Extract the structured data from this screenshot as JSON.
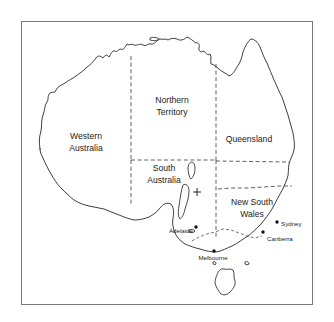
{
  "figure": {
    "frame": {
      "x": 21,
      "y": 21,
      "width": 292,
      "height": 284,
      "stroke_color": "#7a7a7a",
      "background": "#ffffff"
    },
    "coast_color": "#1b1b1b",
    "border_color": "#2b2b2b",
    "label_color": "#1a1a1a"
  },
  "states": [
    {
      "id": "western-australia",
      "label_line1": "Western",
      "label_line2": "Australia",
      "label_x": 86,
      "label_y": 140
    },
    {
      "id": "northern-territory",
      "label_line1": "Northern",
      "label_line2": "Territory",
      "label_x": 172,
      "label_y": 105
    },
    {
      "id": "queensland",
      "label_line1": "Queensland",
      "label_line2": "",
      "label_x": 249,
      "label_y": 140
    },
    {
      "id": "south-australia",
      "label_line1": "South",
      "label_line2": "Australia",
      "label_x": 165,
      "label_y": 172
    },
    {
      "id": "new-south-wales",
      "label_line1": "New South",
      "label_line2": "Wales",
      "label_x": 252,
      "label_y": 205
    }
  ],
  "cities": [
    {
      "id": "sydney",
      "name": "Sydney",
      "dot_x": 277,
      "dot_y": 222,
      "label_x": 281,
      "label_y": 224,
      "align": "right"
    },
    {
      "id": "canberra",
      "name": "Canberra",
      "dot_x": 263,
      "dot_y": 232,
      "label_x": 267,
      "label_y": 239,
      "align": "right"
    },
    {
      "id": "melbourne",
      "name": "Melbourne",
      "dot_x": 214,
      "dot_y": 251,
      "label_x": 213,
      "label_y": 258,
      "align": "center"
    },
    {
      "id": "adelaide",
      "name": "Adelaide",
      "dot_x": 196,
      "dot_y": 227,
      "label_x": 193,
      "label_y": 231,
      "align": "left"
    }
  ],
  "markers": [
    {
      "id": "site-marker",
      "symbol": "+",
      "x": 197,
      "y": 192,
      "size": 4.2
    }
  ],
  "geometry": {
    "mainland": "M 41 145 L 40 136 L 42 128 L 41 121 L 44 114 L 43 108 L 47 103 L 46 97 L 50 94 L 54 96 L 55 91 L 60 87 L 64 85 L 68 81 L 73 79 L 77 75 L 82 73 L 85 69 L 89 66 L 93 63 L 96 58 L 99 56 L 103 57 L 105 54 L 108 57 L 111 54 L 113 50 L 117 52 L 119 48 L 122 50 L 125 47 L 126 43 L 130 45 L 133 42 L 136 45 L 140 43 L 143 46 L 146 43 L 148 46 L 152 44 L 155 41 L 159 39 L 162 41 L 164 38 L 168 40 L 171 37 L 175 39 L 179 38 L 182 41 L 186 40 L 189 37 L 192 39 L 195 43 L 199 41 L 200 45 L 198 49 L 201 52 L 204 50 L 206 54 L 209 52 L 211 56 L 208 60 L 210 64 L 214 63 L 217 67 L 221 70 L 225 72 L 228 76 L 232 74 L 236 70 L 239 65 L 241 59 L 243 53 L 245 47 L 248 42 L 252 39 L 256 41 L 259 45 L 261 51 L 263 57 L 266 62 L 269 67 L 271 73 L 273 79 L 276 84 L 278 90 L 281 95 L 283 101 L 285 107 L 287 113 L 289 119 L 290 125 L 292 131 L 293 137 L 294 143 L 293 149 L 291 154 L 289 159 L 288 165 L 289 171 L 288 177 L 285 182 L 283 188 L 280 193 L 277 198 L 274 203 L 271 208 L 268 213 L 264 218 L 260 223 L 256 228 L 251 232 L 246 236 L 241 240 L 236 243 L 231 246 L 226 249 L 221 251 L 216 252 L 211 251 L 206 250 L 201 249 L 196 248 L 191 247 L 186 245 L 181 242 L 177 238 L 174 233 L 172 228 L 171 223 L 172 218 L 173 213 L 172 208 L 169 204 L 165 203 L 161 205 L 158 209 L 155 213 L 151 216 L 147 218 L 142 219 L 137 220 L 132 219 L 127 218 L 122 216 L 117 214 L 112 212 L 107 210 L 102 209 L 97 208 L 92 207 L 87 206 L 82 204 L 77 202 L 73 198 L 69 194 L 65 190 L 61 186 L 57 182 L 54 177 L 51 172 L 48 167 L 45 162 L 43 157 L 41 151 Z",
    "tasmania": "M 216 275 L 219 270 L 223 268 L 227 270 L 231 268 L 234 271 L 233 276 L 235 280 L 234 285 L 231 289 L 228 293 L 224 295 L 221 293 L 219 289 L 216 286 L 215 281 Z",
    "state_borders": [
      "M 131 55 L 131 107",
      "M 131 107 L 131 160",
      "M 131 160 L 216 160",
      "M 216 160 L 216 78",
      "M 216 78 L 216 62",
      "M 216 160 L 216 192",
      "M 216 160 L 286 161",
      "M 216 192 L 291 187",
      "M 216 192 L 216 240",
      "M 216 192 L 218 214"
    ],
    "nsw_vic_border": "M 193 240 L 200 236 L 208 234 L 216 231 L 224 229 L 232 230 L 240 233 L 248 236 L 256 238 L 262 236"
  }
}
